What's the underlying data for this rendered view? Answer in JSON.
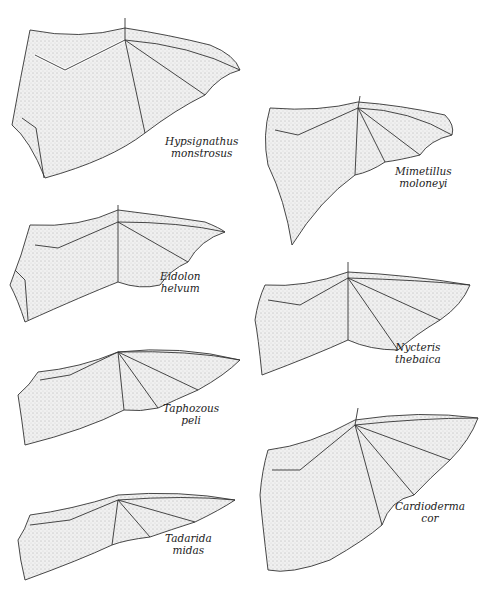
{
  "figure": {
    "species": [
      {
        "genus": "Hypsignathus",
        "species": "monstrosus",
        "column": "left",
        "order": 1
      },
      {
        "genus": "Eidolon",
        "species": "helvum",
        "column": "left",
        "order": 2
      },
      {
        "genus": "Taphozous",
        "species": "peli",
        "column": "left",
        "order": 3
      },
      {
        "genus": "Tadarida",
        "species": "midas",
        "column": "left",
        "order": 4
      },
      {
        "genus": "Mimetillus",
        "species": "moloneyi",
        "column": "right",
        "order": 1
      },
      {
        "genus": "Nycteris",
        "species": "thebaica",
        "column": "right",
        "order": 2
      },
      {
        "genus": "Cardioderma",
        "species": "cor",
        "column": "right",
        "order": 3
      }
    ]
  },
  "style": {
    "line_color": "#333333",
    "fill_color": "#e6e6e6",
    "background": "#ffffff"
  }
}
